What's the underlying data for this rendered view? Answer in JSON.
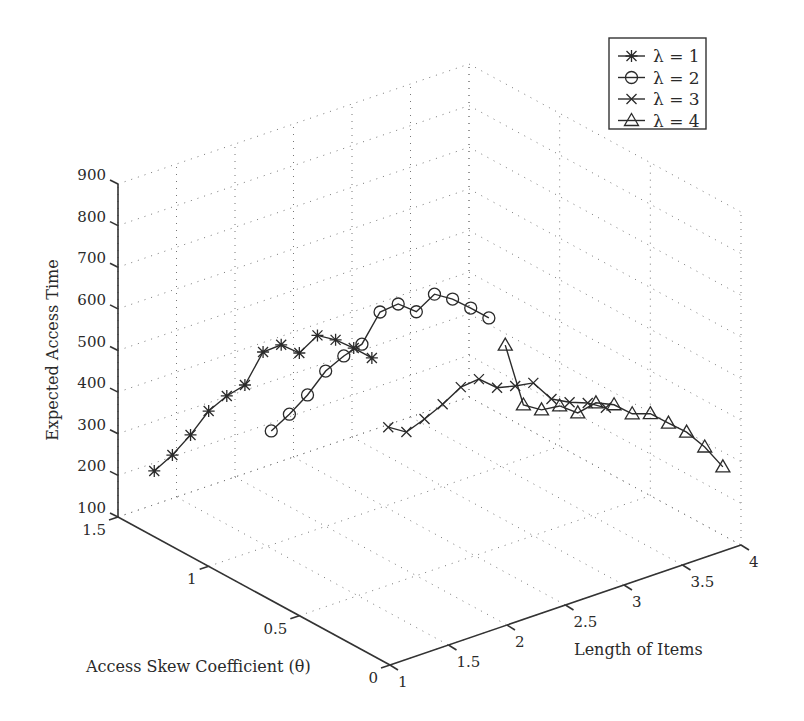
{
  "chart_data": {
    "type": "line3d",
    "title": "",
    "zlabel": "Expected Access Time",
    "xlabel": "Access Skew Coefficient (θ)",
    "ylabel": "Length of Items",
    "z_ticks": [
      "100",
      "200",
      "300",
      "400",
      "500",
      "600",
      "700",
      "800",
      "900"
    ],
    "theta_ticks": [
      "0",
      "0.5",
      "1",
      "1.5"
    ],
    "length_ticks": [
      "1",
      "1.5",
      "2",
      "2.5",
      "3",
      "3.5",
      "4"
    ],
    "zlim": [
      100,
      900
    ],
    "theta_lim": [
      0,
      1.5
    ],
    "length_lim": [
      1,
      4
    ],
    "grid": true,
    "legend_position": "top-right",
    "theta": [
      1.3,
      1.2,
      1.1,
      1.0,
      0.9,
      0.8,
      0.7,
      0.6,
      0.5,
      0.4,
      0.3,
      0.2,
      0.1
    ],
    "series": [
      {
        "name": "λ = 1",
        "length": 1,
        "marker": "asterisk",
        "values": [
          258,
          320,
          392,
          473,
          533,
          583,
          686,
          727,
          731,
          797,
          810,
          814,
          814
        ]
      },
      {
        "name": "λ = 2",
        "length": 2,
        "marker": "circle",
        "values": [
          258,
          322,
          392,
          473,
          533,
          585,
          686,
          729,
          734,
          800,
          812,
          814,
          814
        ]
      },
      {
        "name": "λ = 3",
        "length": 3,
        "marker": "x",
        "values": [
          171,
          183,
          238,
          297,
          362,
          405,
          408,
          436,
          467,
          452,
          468,
          490,
          502
        ]
      },
      {
        "name": "λ = 4",
        "length": 4,
        "marker": "triangle",
        "values": [
          272,
          152,
          164,
          197,
          204,
          252,
          271,
          273,
          297,
          298,
          300,
          288,
          264
        ]
      }
    ]
  },
  "legend": {
    "items": [
      {
        "label": "λ = 1",
        "marker": "asterisk"
      },
      {
        "label": "λ = 2",
        "marker": "circle"
      },
      {
        "label": "λ = 3",
        "marker": "x"
      },
      {
        "label": "λ = 4",
        "marker": "triangle"
      }
    ]
  }
}
